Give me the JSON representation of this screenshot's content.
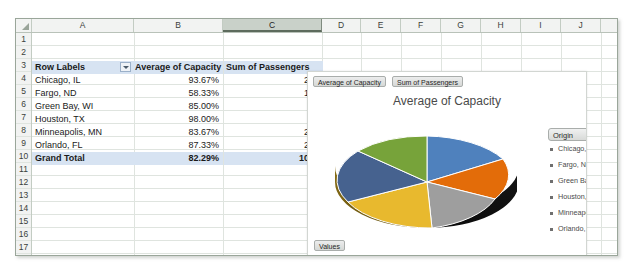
{
  "spreadsheet": {
    "columns": [
      "A",
      "B",
      "C",
      "D",
      "E",
      "F",
      "G",
      "H",
      "I",
      "J",
      "K"
    ],
    "selected_column": "C",
    "rows": [
      "1",
      "2",
      "3",
      "4",
      "5",
      "6",
      "7",
      "8",
      "9",
      "10",
      "11",
      "12",
      "13",
      "14",
      "15",
      "16",
      "17"
    ],
    "select_all_icon": "select-all-triangle-icon",
    "filter_icon": "filter-dropdown-icon"
  },
  "pivot": {
    "headers": {
      "row_labels": "Row Labels",
      "avg_capacity": "Average of Capacity",
      "sum_passengers": "Sum of Passengers"
    },
    "rows": [
      {
        "label": "Chicago, IL",
        "capacity": "93.67%",
        "passengers": "260"
      },
      {
        "label": "Fargo, ND",
        "capacity": "58.33%",
        "passengers": "133"
      },
      {
        "label": "Green Bay, WI",
        "capacity": "85.00%",
        "passengers": "80"
      },
      {
        "label": "Houston, TX",
        "capacity": "98.00%",
        "passengers": "90"
      },
      {
        "label": "Minneapolis, MN",
        "capacity": "83.67%",
        "passengers": "215"
      },
      {
        "label": "Orlando, FL",
        "capacity": "87.33%",
        "passengers": "240"
      }
    ],
    "total": {
      "label": "Grand Total",
      "capacity": "82.29%",
      "passengers": "1018"
    }
  },
  "chart": {
    "field_buttons": [
      "Average of Capacity",
      "Sum of Passengers"
    ],
    "values_button": "Values",
    "title": "Average of Capacity",
    "legend": {
      "header": "Origin",
      "dropdown_icon": "chevron-down-icon",
      "items": [
        "Chicago, IL",
        "Fargo, ND",
        "Green Bay, WI",
        "Houston, TX",
        "Minneapolis, MN",
        "Orlando, FL"
      ]
    }
  },
  "chart_data": {
    "type": "pie",
    "title": "Average of Capacity",
    "categories": [
      "Chicago, IL",
      "Fargo, ND",
      "Green Bay, WI",
      "Houston, TX",
      "Minneapolis, MN",
      "Orlando, FL"
    ],
    "values": [
      93.67,
      58.33,
      85.0,
      98.0,
      83.67,
      87.33
    ],
    "value_unit": "percent",
    "colors": [
      "#4F81BD",
      "#E36C09",
      "#9E9E9E",
      "#E8B92E",
      "#46628F",
      "#77A33A"
    ],
    "legend_position": "right",
    "three_d": true,
    "xlabel": "",
    "ylabel": ""
  }
}
